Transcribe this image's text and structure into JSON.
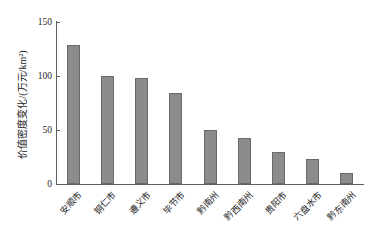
{
  "chart_data": {
    "type": "bar",
    "title": "",
    "xlabel": "",
    "ylabel": "价值密度变化/(万元/km²)",
    "categories": [
      "安顺市",
      "铜仁市",
      "遵义市",
      "毕节市",
      "黔南州",
      "黔西南州",
      "贵阳市",
      "六盘水市",
      "黔东南州"
    ],
    "values": [
      129,
      100,
      98,
      84,
      50,
      43,
      30,
      23,
      10
    ],
    "ylim": [
      0,
      150
    ],
    "yticks": [
      0,
      50,
      100,
      150
    ],
    "ytick_labels": [
      "0",
      "50",
      "100",
      "150"
    ],
    "grid": false,
    "legend": null,
    "bar_color": "#8c8c8c",
    "bar_edge_color": "#6a6a6a",
    "axis_color": "#5f5f5f",
    "background": "#ffffff"
  }
}
